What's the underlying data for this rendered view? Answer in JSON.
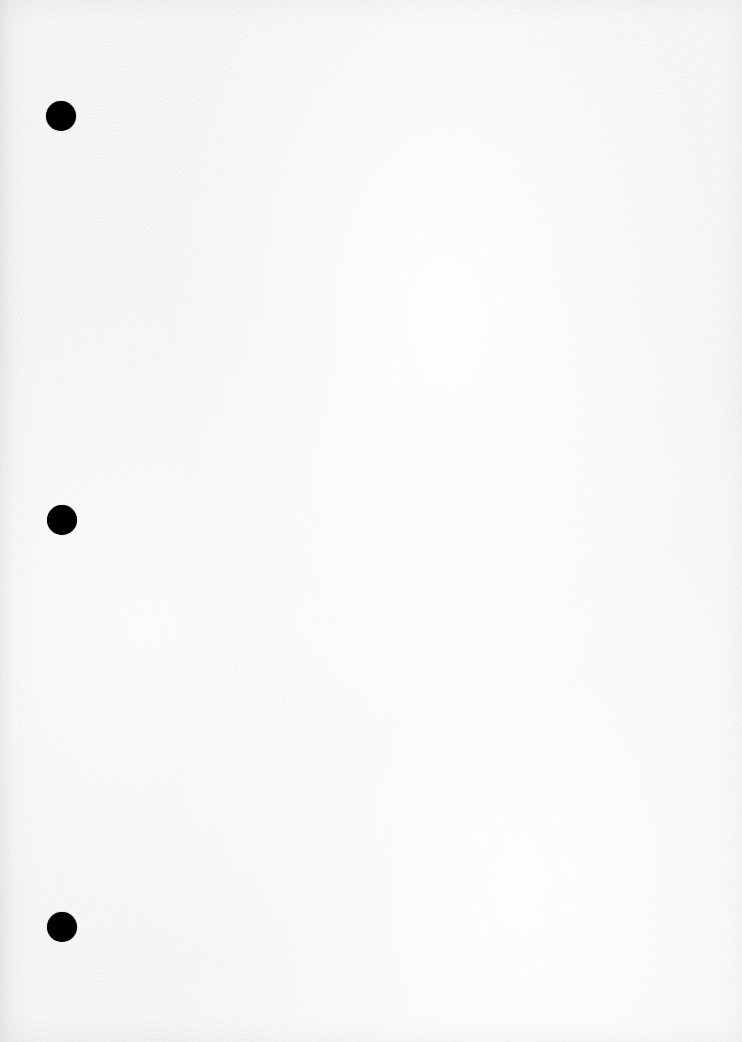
{
  "paper": {
    "description": "Blank white textured sheet of hole-punched paper",
    "background_color": "#f6f6f6",
    "hole_color": "#000000",
    "holes": [
      {
        "id": "top",
        "cx": 61,
        "cy": 116,
        "diameter": 30
      },
      {
        "id": "middle",
        "cx": 62,
        "cy": 520,
        "diameter": 30
      },
      {
        "id": "bottom",
        "cx": 62,
        "cy": 927,
        "diameter": 30
      }
    ]
  }
}
